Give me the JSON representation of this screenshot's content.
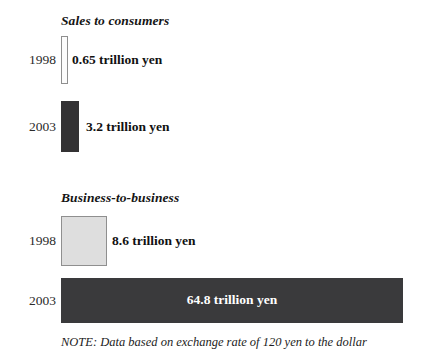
{
  "chart_data": {
    "type": "bar",
    "title": "",
    "subtitle": "",
    "xlabel": "",
    "ylabel": "",
    "orientation": "horizontal",
    "grid": false,
    "legend": "none",
    "unit": "trillion yen",
    "note": "NOTE: Data based on exchange rate of 120 yen to the dollar",
    "groups": [
      {
        "name": "Sales to consumers",
        "categories": [
          "1998",
          "2003"
        ],
        "values": [
          0.65,
          3.2
        ],
        "value_labels": [
          "0.65 trillion yen",
          "3.2 trillion yen"
        ],
        "bar_colors": [
          "#fcfcfc",
          "#333234"
        ]
      },
      {
        "name": "Business-to-business",
        "categories": [
          "1998",
          "2003"
        ],
        "values": [
          8.6,
          64.8
        ],
        "value_labels": [
          "8.6 trillion yen",
          "64.8 trillion yen"
        ],
        "bar_colors": [
          "#dedede",
          "#3a3a3c"
        ]
      }
    ]
  },
  "groups": {
    "consumers": {
      "title": "Sales to consumers",
      "rows": [
        {
          "year": "1998",
          "value_label": "0.65 trillion yen"
        },
        {
          "year": "2003",
          "value_label": "3.2 trillion yen"
        }
      ]
    },
    "b2b": {
      "title": "Business-to-business",
      "rows": [
        {
          "year": "1998",
          "value_label": "8.6 trillion yen"
        },
        {
          "year": "2003",
          "value_label": "64.8 trillion yen"
        }
      ]
    }
  },
  "note": "NOTE: Data based on exchange rate of 120 yen to the dollar"
}
